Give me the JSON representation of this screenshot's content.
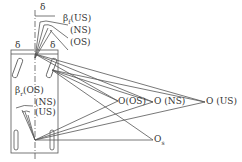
{
  "diagram": {
    "type": "vehicle-steering-kinematics",
    "labels": {
      "delta_top": "δ",
      "beta_f_us": "βf(US)",
      "beta_f_sym": "β",
      "beta_f_sub": "f",
      "us_top": "(US)",
      "ns_top": "(NS)",
      "os_top": "(OS)",
      "delta_left": "δ",
      "delta_right": "δ",
      "beta_r_sym": "β",
      "beta_r_sub": "r",
      "os_rear": "(OS)",
      "ns_rear": "(NS)",
      "us_rear": "(US)",
      "o_os": "O(OS)",
      "o_ns": "O (NS)",
      "o_us": "O (US)",
      "o_s_sym": "O",
      "o_s_sub": "s"
    },
    "points": {
      "front_center": [
        35,
        54
      ],
      "rear_center": [
        35,
        140
      ],
      "O_OS": [
        118,
        101
      ],
      "O_NS": [
        153,
        102
      ],
      "O_US": [
        205,
        102
      ],
      "O_s": [
        153,
        140
      ]
    },
    "colors": {
      "line": "#555555",
      "text": "#333333"
    }
  }
}
